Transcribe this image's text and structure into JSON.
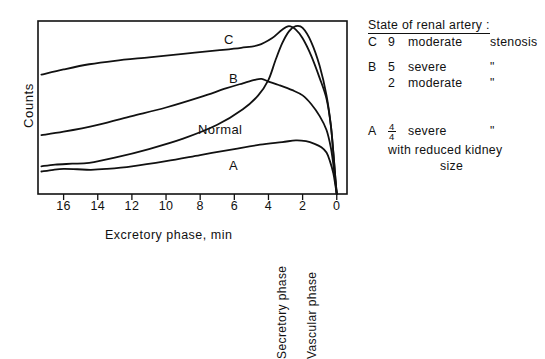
{
  "chart_data": {
    "type": "line",
    "title": "",
    "xlabel": "Excretory phase,  min",
    "ylabel": "Counts",
    "xlim": [
      17.5,
      -0.6
    ],
    "ylim": [
      0,
      100
    ],
    "x_ticks": [
      16,
      14,
      12,
      10,
      8,
      6,
      4,
      2,
      0
    ],
    "x_tick_labels": [
      "16",
      "14",
      "12",
      "10",
      "8",
      "6",
      "4",
      "2",
      "0"
    ],
    "y_ticks": [],
    "grid": false,
    "axis_direction": "reversed",
    "legend_position": "right",
    "phase_labels": [
      "Secretory phase",
      "Vascular phase"
    ],
    "annotations": [
      "C",
      "B",
      "Normal",
      "A"
    ],
    "series": [
      {
        "name": "C",
        "label": "C",
        "x": [
          17.3,
          16.0,
          14.5,
          13.0,
          11.0,
          9.0,
          7.0,
          5.6,
          4.6,
          3.8,
          3.2,
          2.8,
          2.4,
          2.0,
          1.5,
          1.0,
          0.6,
          0.35,
          0.2,
          0.08,
          0.0
        ],
        "y": [
          69,
          72,
          75,
          77,
          79,
          81,
          83,
          84.5,
          86,
          90,
          95,
          97,
          95,
          90,
          80,
          67,
          55,
          40,
          24,
          9,
          0
        ]
      },
      {
        "name": "B",
        "label": "B",
        "x": [
          17.3,
          16.0,
          14.0,
          12.0,
          10.0,
          8.0,
          6.5,
          5.5,
          4.8,
          4.4,
          4.0,
          3.4,
          2.6,
          2.0,
          1.5,
          1.0,
          0.6,
          0.35,
          0.2,
          0.08,
          0.0
        ],
        "y": [
          34,
          36,
          40,
          45,
          50,
          56,
          61,
          64,
          66,
          66.5,
          65,
          63,
          60,
          57,
          52,
          45,
          37,
          27,
          17,
          7,
          0
        ]
      },
      {
        "name": "Normal",
        "label": "Normal",
        "x": [
          17.3,
          16.5,
          15.5,
          14.5,
          13.0,
          11.0,
          9.0,
          7.0,
          5.5,
          4.6,
          4.0,
          3.6,
          3.2,
          2.8,
          2.4,
          2.0,
          1.5,
          1.0,
          0.6,
          0.35,
          0.2,
          0.08,
          0.0
        ],
        "y": [
          16,
          17,
          17.5,
          18,
          21,
          26,
          32,
          40,
          49,
          57,
          66,
          77,
          87,
          94,
          97,
          96,
          88,
          74,
          57,
          40,
          24,
          9,
          0
        ]
      },
      {
        "name": "A",
        "label": "A",
        "x": [
          17.3,
          16.6,
          16.0,
          15.2,
          14.4,
          13.5,
          12.0,
          10.0,
          8.0,
          6.0,
          4.5,
          3.2,
          2.4,
          1.8,
          1.3,
          0.9,
          0.6,
          0.4,
          0.2,
          0.08,
          0.0
        ],
        "y": [
          13,
          14,
          14.5,
          14.3,
          14,
          14.5,
          16,
          19,
          22.5,
          26,
          28.5,
          30,
          31,
          30.5,
          29,
          27,
          24,
          19,
          12,
          5,
          0
        ]
      }
    ]
  },
  "axes": {
    "y_title": "Counts",
    "x_title": "Excretory phase,  min",
    "x_tick_labels": [
      "16",
      "14",
      "12",
      "10",
      "8",
      "6",
      "4",
      "2",
      "0"
    ]
  },
  "phases": {
    "secretory": "Secretory phase",
    "vascular": "Vascular phase"
  },
  "curve_labels": {
    "c": "C",
    "b": "B",
    "normal": "Normal",
    "a": "A"
  },
  "legend": {
    "title": "State of renal artery :",
    "c": {
      "key": "C",
      "count": "9",
      "desc": "moderate",
      "suffix": "stenosis"
    },
    "b": {
      "key": "B",
      "line1": {
        "count": "5",
        "desc": "severe",
        "ditto": "\""
      },
      "line2": {
        "count": "2",
        "desc": "moderate",
        "ditto": "\""
      }
    },
    "a": {
      "key": "A",
      "numerator": "4",
      "denominator": "4",
      "desc": "severe",
      "ditto": "\"",
      "line2": "with reduced kidney",
      "line3": "size"
    }
  },
  "style": {
    "ink": "#111111",
    "background": "#ffffff"
  }
}
